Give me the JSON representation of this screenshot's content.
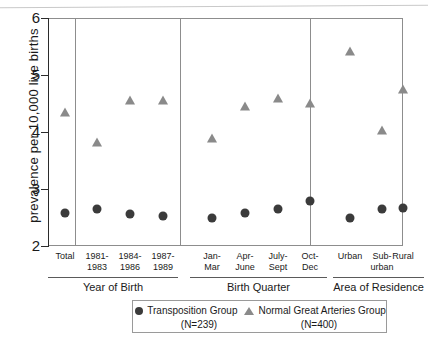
{
  "chart_data": {
    "type": "scatter",
    "title": "",
    "xlabel": "",
    "ylabel": "prevalence per 10,000 live births",
    "ylim": [
      2,
      6
    ],
    "yticks": [
      2,
      3,
      4,
      5,
      6
    ],
    "ytick_labels": [
      "2",
      "3",
      "4",
      "5",
      "6"
    ],
    "grid": false,
    "legend_position": "bottom",
    "categories": [
      "Total",
      "1981-\n1983",
      "1984-\n1986",
      "1987-\n1989",
      "Jan-\nMar",
      "Apr-\nJune",
      "July-\nSept",
      "Oct-\nDec",
      "Urban",
      "Sub-\nurban",
      "Rural"
    ],
    "panels": [
      {
        "label": "Year of Birth",
        "categories": [
          "Total",
          "1981-1983",
          "1984-1986",
          "1987-1989"
        ]
      },
      {
        "label": "Birth Quarter",
        "categories": [
          "Jan-Mar",
          "Apr-June",
          "July-Sept",
          "Oct-Dec"
        ]
      },
      {
        "label": "Area of Residence",
        "categories": [
          "Urban",
          "Sub-urban",
          "Rural"
        ]
      }
    ],
    "series": [
      {
        "name": "Transposition Group",
        "n_label": "(N=239)",
        "marker": "circle",
        "color": "#3b3b3b",
        "values": [
          2.58,
          2.65,
          2.56,
          2.53,
          2.49,
          2.58,
          2.65,
          2.79,
          2.49,
          2.65,
          2.67
        ]
      },
      {
        "name": "Normal Great Arteries Group",
        "n_label": "(N=400)",
        "marker": "triangle",
        "color": "#8a8a8a",
        "values": [
          4.35,
          3.82,
          4.56,
          4.57,
          3.9,
          4.46,
          4.6,
          4.51,
          5.42,
          4.04,
          4.75
        ]
      }
    ]
  },
  "legend": {
    "series_1_label": "Transposition Group",
    "series_1_n": "(N=239)",
    "series_2_label": "Normal Great Arteries Group",
    "series_2_n": "(N=400)"
  },
  "axis": {
    "y_title": "prevalence per 10,000 live births"
  }
}
